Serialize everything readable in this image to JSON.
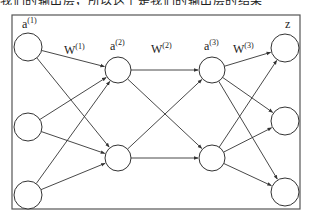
{
  "caption_fragment": "我们的输出层，所以这个是我们的输出层的结果",
  "diagram": {
    "frame": {
      "x": 12,
      "y": 15,
      "w": 288,
      "h": 194,
      "stroke": "#555555"
    },
    "colors": {
      "stroke": "#333333",
      "node_fill": "#ffffff",
      "edge": "#333333"
    },
    "layers": [
      {
        "name": "a",
        "superscript": "(1)",
        "label_x": 22,
        "label_y": 28,
        "nodes": [
          {
            "cx": 28,
            "cy": 47
          },
          {
            "cx": 28,
            "cy": 127
          },
          {
            "cx": 28,
            "cy": 195
          }
        ],
        "r": 14
      },
      {
        "name": "a",
        "superscript": "(2)",
        "label_x": 110,
        "label_y": 50,
        "nodes": [
          {
            "cx": 118,
            "cy": 70
          },
          {
            "cx": 118,
            "cy": 158
          }
        ],
        "r": 13
      },
      {
        "name": "a",
        "superscript": "(3)",
        "label_x": 204,
        "label_y": 50,
        "nodes": [
          {
            "cx": 212,
            "cy": 70
          },
          {
            "cx": 212,
            "cy": 158
          }
        ],
        "r": 13
      },
      {
        "name": "z",
        "superscript": "",
        "label_x": 285,
        "label_y": 28,
        "nodes": [
          {
            "cx": 285,
            "cy": 48
          },
          {
            "cx": 285,
            "cy": 121
          },
          {
            "cx": 285,
            "cy": 192
          }
        ],
        "r": 14
      }
    ],
    "weights": [
      {
        "name": "W",
        "superscript": "(1)",
        "x": 64,
        "y": 54
      },
      {
        "name": "W",
        "superscript": "(2)",
        "x": 151,
        "y": 53
      },
      {
        "name": "W",
        "superscript": "(3)",
        "x": 233,
        "y": 53
      }
    ]
  }
}
